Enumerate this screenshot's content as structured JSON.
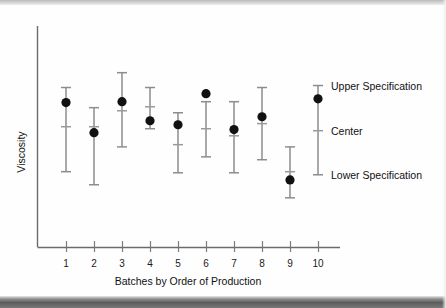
{
  "chart_data": {
    "type": "scatter",
    "title": "",
    "subtitle": "",
    "xlabel": "Batches by Order of Production",
    "ylabel": "Viscosity",
    "categories": [
      "1",
      "2",
      "3",
      "4",
      "5",
      "6",
      "7",
      "8",
      "9",
      "10"
    ],
    "grid": false,
    "legend_position": "right",
    "xlim": [
      0.5,
      10.5
    ],
    "ylim": [
      0,
      100
    ],
    "axis_note": "Viscosity axis is unlabeled (no numeric ticks); values estimated from pixel positions on a 0-100 relative scale.",
    "series": [
      {
        "name": "Batch measurement (dot)",
        "marker": "filled-circle",
        "values": [
          65.2,
          51.6,
          65.6,
          57.0,
          55.2,
          69.2,
          53.0,
          58.8,
          30.3,
          66.9
        ]
      },
      {
        "name": "Upper Specification (whisker top)",
        "values": [
          72.0,
          62.9,
          78.7,
          72.0,
          60.6,
          65.6,
          65.6,
          72.0,
          45.2,
          72.9
        ]
      },
      {
        "name": "Center (cross tick)",
        "values": [
          54.3,
          54.3,
          61.5,
          63.3,
          46.2,
          53.4,
          50.2,
          55.7,
          34.0,
          52.5
        ]
      },
      {
        "name": "Lower Specification (whisker bottom)",
        "values": [
          34.0,
          28.1,
          45.2,
          53.4,
          33.5,
          40.7,
          33.5,
          39.4,
          22.2,
          32.6
        ]
      }
    ],
    "legend": [
      {
        "label": "Upper Specification",
        "marker": "whisker-cap-top"
      },
      {
        "label": "Center",
        "marker": "center-cross-tick"
      },
      {
        "label": "Lower Specification",
        "marker": "whisker-cap-bottom"
      }
    ],
    "colors": {
      "marker": "#111111",
      "whisker": "#8d8d8d",
      "axis": "#6b6b6b",
      "text": "#111111",
      "background": "#fefefe"
    }
  },
  "legend_reference_bar": {
    "note": "The 10th batch error bar doubles as the legend key; labels sit to its right.",
    "upper_label": "Upper Specification",
    "center_label": "Center",
    "lower_label": "Lower Specification"
  }
}
